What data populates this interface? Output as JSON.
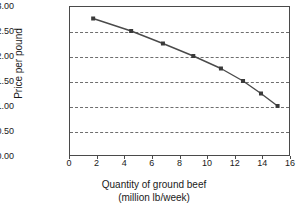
{
  "chart_data": {
    "type": "line",
    "title": "",
    "xlabel": "Quantity of ground beef",
    "xlabel_line2": "(million lb/week)",
    "ylabel": "Price per pound",
    "xlim": [
      0,
      16
    ],
    "ylim": [
      0,
      3.0
    ],
    "grid": "horizontal-dashed",
    "legend": "none",
    "marker": "square",
    "line_color": "#4a4a4a",
    "marker_color": "#3a3a3a",
    "x": [
      1.75,
      4.5,
      6.8,
      9.0,
      11.0,
      12.6,
      13.9,
      15.1
    ],
    "values": [
      2.75,
      2.5,
      2.25,
      2.0,
      1.75,
      1.5,
      1.25,
      1.0
    ],
    "points": [
      {
        "x": 1.75,
        "y": 2.75,
        "label": "$2.75"
      },
      {
        "x": 4.5,
        "y": 2.5,
        "label": "$2.50"
      },
      {
        "x": 6.8,
        "y": 2.25,
        "label": "$2.25"
      },
      {
        "x": 9.0,
        "y": 2.0,
        "label": "$2.00"
      },
      {
        "x": 11.0,
        "y": 1.75,
        "label": "$1.75"
      },
      {
        "x": 12.6,
        "y": 1.5,
        "label": "$1.50"
      },
      {
        "x": 13.9,
        "y": 1.25,
        "label": "$1.25"
      },
      {
        "x": 15.1,
        "y": 1.0,
        "label": "$1.00"
      }
    ],
    "yticks": [
      {
        "value": 3.0,
        "label": "$3.00"
      },
      {
        "value": 2.5,
        "label": "$2.50"
      },
      {
        "value": 2.0,
        "label": "$2.00"
      },
      {
        "value": 1.5,
        "label": "$1.50"
      },
      {
        "value": 1.0,
        "label": "$1.00"
      },
      {
        "value": 0.5,
        "label": "$0.50"
      },
      {
        "value": 0.0,
        "label": "$0.00"
      }
    ],
    "xticks": [
      {
        "value": 0,
        "label": "0"
      },
      {
        "value": 2,
        "label": "2"
      },
      {
        "value": 4,
        "label": "4"
      },
      {
        "value": 6,
        "label": "6"
      },
      {
        "value": 8,
        "label": "8"
      },
      {
        "value": 10,
        "label": "10"
      },
      {
        "value": 12,
        "label": "12"
      },
      {
        "value": 14,
        "label": "14"
      },
      {
        "value": 16,
        "label": "16"
      }
    ]
  }
}
